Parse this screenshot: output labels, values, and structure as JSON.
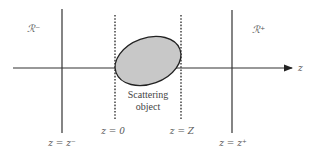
{
  "diagram": {
    "type": "scattering-geometry",
    "regions": {
      "left": "ℛ⁻",
      "right": "ℛ⁺"
    },
    "axis_label": "z",
    "object_label_line1": "Scattering",
    "object_label_line2": "object",
    "planes": {
      "z_minus": "z = z⁻",
      "z_zero": "z = 0",
      "z_Z": "z = Z",
      "z_plus": "z = z⁺"
    },
    "colors": {
      "line": "#333333",
      "object_fill": "#c8c8c8",
      "object_stroke": "#222222",
      "text": "#555555"
    }
  }
}
